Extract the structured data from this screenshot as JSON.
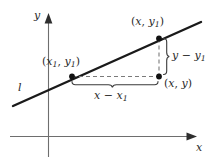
{
  "figure": {
    "background_color": "#ffffff",
    "axis_color": "#6e6e6e",
    "line_color": "#1a1a1a",
    "dash_color": "#7a7a7a",
    "text_color": "#2b2b2b"
  },
  "axes": {
    "y_label": "y",
    "x_label": "x"
  },
  "line": {
    "label": "l"
  },
  "points": {
    "top_right": {
      "open": "(",
      "x": "x",
      "comma": ", ",
      "y": "y",
      "y_sub": "1",
      "close": ")"
    },
    "left": {
      "open": "(",
      "x": "x",
      "x_sub": "1",
      "comma": ", ",
      "y": "y",
      "y_sub": "1",
      "close": ")"
    },
    "bottom_right": {
      "open": "(",
      "x": "x",
      "comma": ", ",
      "y": "y",
      "close": ")"
    }
  },
  "braces": {
    "rise": {
      "minuend": "y",
      "operator": " − ",
      "subtrahend": "y",
      "subtrahend_sub": "1"
    },
    "run": {
      "minuend": "x",
      "operator": " − ",
      "subtrahend": "x",
      "subtrahend_sub": "1"
    }
  }
}
